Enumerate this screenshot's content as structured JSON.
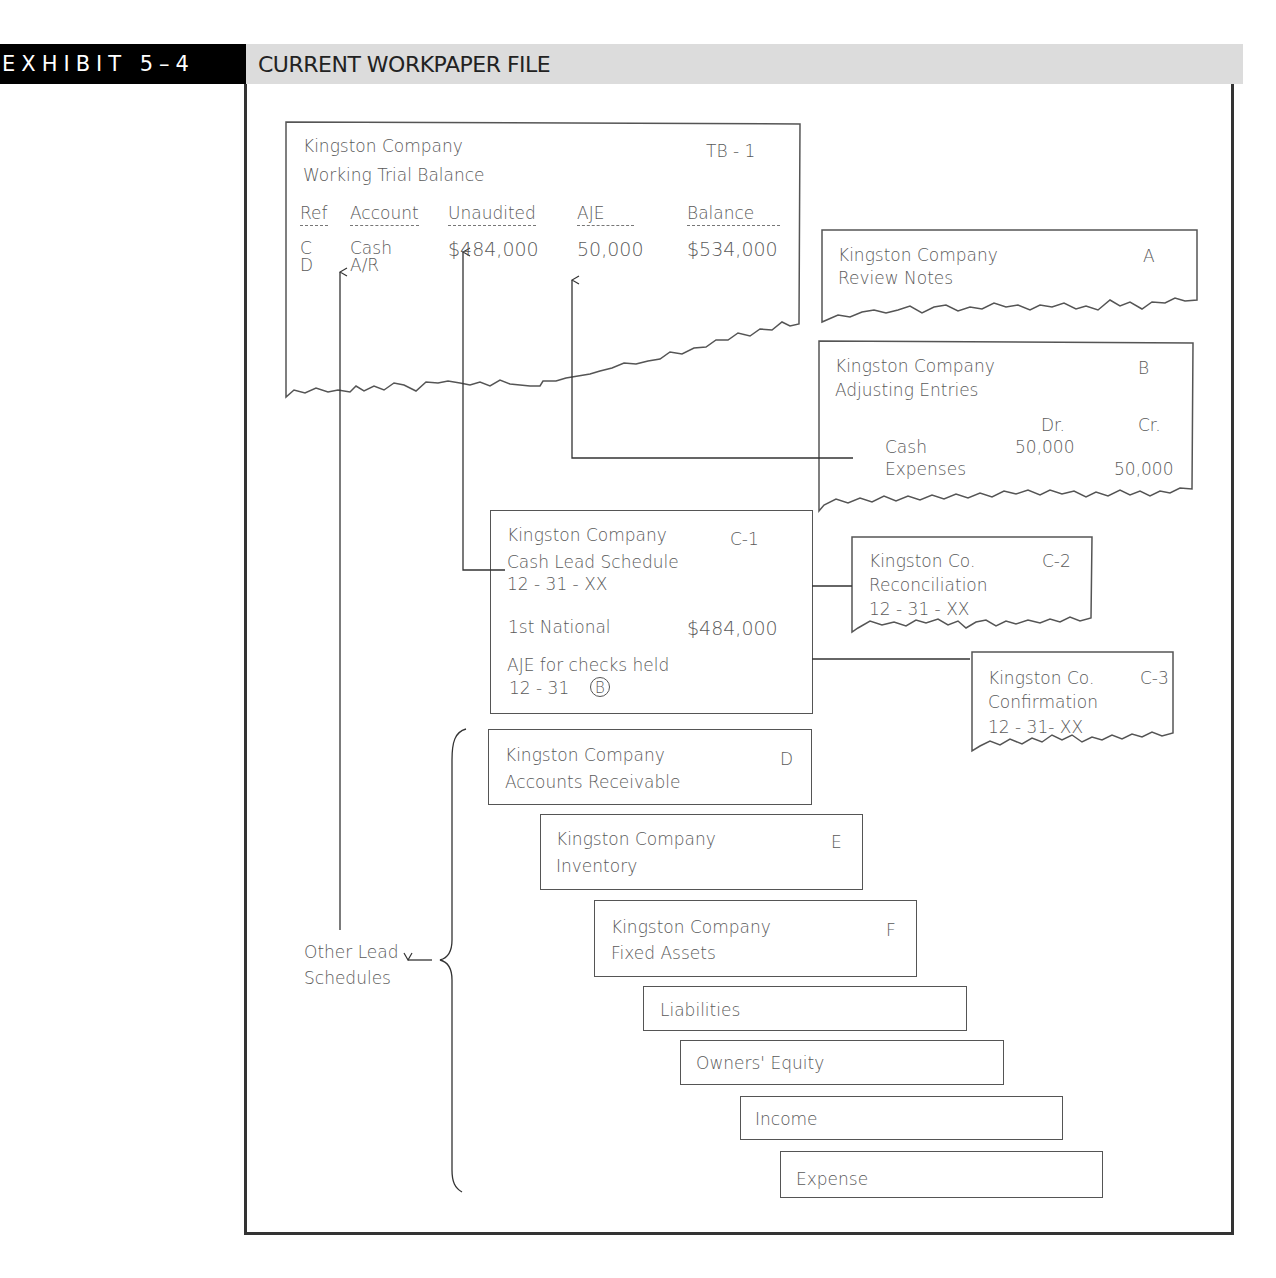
{
  "header": {
    "exhibit_label": "EXHIBIT 5–4",
    "title": "CURRENT WORKPAPER FILE"
  },
  "trial_balance": {
    "company": "Kingston Company",
    "title": "Working Trial Balance",
    "ref": "TB - 1",
    "columns": [
      "Ref",
      "Account",
      "Unaudited",
      "AJE",
      "Balance"
    ],
    "rows": [
      {
        "ref": "C",
        "account": "Cash",
        "unaudited": "$484,000",
        "aje": "50,000",
        "balance": "$534,000"
      },
      {
        "ref": "D",
        "account": "A/R",
        "unaudited": "",
        "aje": "",
        "balance": ""
      }
    ]
  },
  "review_notes": {
    "company": "Kingston Company",
    "title": "Review Notes",
    "ref": "A"
  },
  "adjusting_entries": {
    "company": "Kingston Company",
    "title": "Adjusting Entries",
    "ref": "B",
    "dr_label": "Dr.",
    "cr_label": "Cr.",
    "entries": [
      {
        "account": "Cash",
        "dr": "50,000",
        "cr": ""
      },
      {
        "account": "Expenses",
        "dr": "",
        "cr": "50,000"
      }
    ]
  },
  "cash_lead": {
    "company": "Kingston Company",
    "title": "Cash Lead Schedule",
    "date": "12 - 31 - XX",
    "ref": "C-1",
    "line_label": "1st National",
    "line_amount": "$484,000",
    "aje_note": "AJE for checks held",
    "aje_date": "12 - 31",
    "aje_ref": "B"
  },
  "reconciliation": {
    "company": "Kingston Co.",
    "title": "Reconciliation",
    "date": "12 - 31 - XX",
    "ref": "C-2"
  },
  "confirmation": {
    "company": "Kingston Co.",
    "title": "Confirmation",
    "date": "12 - 31- XX",
    "ref": "C-3"
  },
  "lead_schedules": [
    {
      "company": "Kingston Company",
      "title": "Accounts Receivable",
      "ref": "D"
    },
    {
      "company": "Kingston Company",
      "title": "Inventory",
      "ref": "E"
    },
    {
      "company": "Kingston Company",
      "title": "Fixed Assets",
      "ref": "F"
    },
    {
      "company": "",
      "title": "Liabilities",
      "ref": ""
    },
    {
      "company": "",
      "title": "Owners' Equity",
      "ref": ""
    },
    {
      "company": "",
      "title": "Income",
      "ref": ""
    },
    {
      "company": "",
      "title": "Expense",
      "ref": ""
    }
  ],
  "other_lead_label": {
    "line1": "Other Lead",
    "line2": "Schedules"
  },
  "colors": {
    "header_black": "#000000",
    "header_gray": "#dcdcdc",
    "line": "#555555",
    "text": "#5a5a5a"
  }
}
